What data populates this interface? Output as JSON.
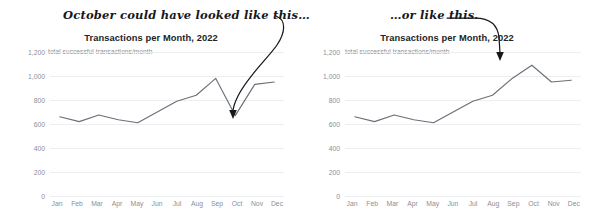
{
  "charts": [
    {
      "id": "left",
      "annotation": "October could have looked like this…",
      "title": "Transactions per Month, 2022",
      "subtitle": "total successful transactions/month"
    },
    {
      "id": "right",
      "annotation": "…or like this.",
      "title": "Transactions per Month, 2022",
      "subtitle": "total successful transactions/month"
    }
  ],
  "axis": {
    "yticks": [
      "0",
      "200",
      "400",
      "600",
      "800",
      "1,000",
      "1,200"
    ],
    "ytick_values": [
      0,
      200,
      400,
      600,
      800,
      1000,
      1200
    ],
    "xticks": [
      "Jan",
      "Feb",
      "Mar",
      "Apr",
      "May",
      "Jun",
      "Jul",
      "Aug",
      "Sep",
      "Oct",
      "Nov",
      "Dec"
    ]
  },
  "colors": {
    "line": "#6b6f76",
    "grid": "#eceef0",
    "tick_text": "#8b8f96",
    "title_text": "#222428",
    "annotation": "#16181c",
    "background": "#ffffff"
  },
  "chart_data": [
    {
      "type": "line",
      "title": "Transactions per Month, 2022",
      "subtitle": "total successful transactions/month",
      "annotation": "October could have looked like this…",
      "annotation_target": "Oct",
      "xlabel": "",
      "ylabel": "total successful transactions/month",
      "categories": [
        "Jan",
        "Feb",
        "Mar",
        "Apr",
        "May",
        "Jun",
        "Jul",
        "Aug",
        "Sep",
        "Oct",
        "Nov",
        "Dec"
      ],
      "values": [
        660,
        620,
        675,
        635,
        610,
        700,
        790,
        840,
        980,
        670,
        930,
        950
      ],
      "ylim": [
        0,
        1200
      ],
      "yticks": [
        0,
        200,
        400,
        600,
        800,
        1000,
        1200
      ],
      "grid": true,
      "legend": "none"
    },
    {
      "type": "line",
      "title": "Transactions per Month, 2022",
      "subtitle": "total successful transactions/month",
      "annotation": "…or like this.",
      "annotation_target": "Oct",
      "xlabel": "",
      "ylabel": "total successful transactions/month",
      "categories": [
        "Jan",
        "Feb",
        "Mar",
        "Apr",
        "May",
        "Jun",
        "Jul",
        "Aug",
        "Sep",
        "Oct",
        "Nov",
        "Dec"
      ],
      "values": [
        660,
        620,
        675,
        635,
        610,
        700,
        790,
        840,
        980,
        1090,
        950,
        965
      ],
      "ylim": [
        0,
        1200
      ],
      "yticks": [
        0,
        200,
        400,
        600,
        800,
        1000,
        1200
      ],
      "grid": true,
      "legend": "none"
    }
  ]
}
